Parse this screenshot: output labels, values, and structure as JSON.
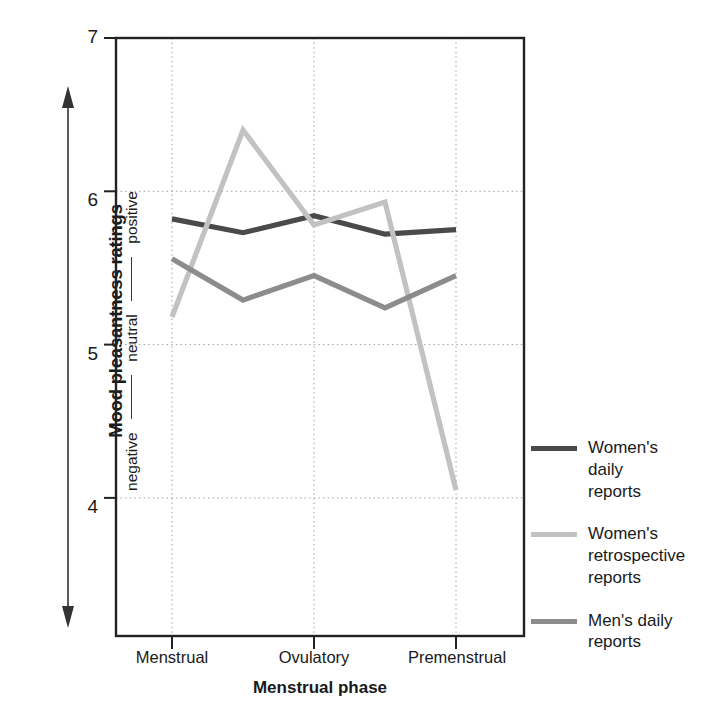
{
  "chart_data": {
    "type": "line",
    "title": "",
    "xlabel": "Menstrual phase",
    "ylabel": "Mood pleasantness ratings",
    "ylabel_scale": [
      "negative",
      "neutral",
      "positive"
    ],
    "categories": [
      "Menstrual",
      "",
      "Ovulatory",
      "",
      "Premenstrual"
    ],
    "x_tick_labels": [
      "Menstrual",
      "Ovulatory",
      "Premenstrual"
    ],
    "x_tick_positions": [
      0,
      2,
      4
    ],
    "y_tick_labels": [
      "7",
      "6",
      "5",
      "4"
    ],
    "y_ticks": [
      7,
      6,
      5,
      4
    ],
    "ylim": [
      3.35,
      7
    ],
    "xlim": [
      -0.42,
      0.42
    ],
    "grid": "dotted",
    "legend_position": "right",
    "series": [
      {
        "name": "Women's daily reports",
        "legend_label": "Women's\ndaily\nreports",
        "color": "#4a4a4a",
        "values": [
          5.82,
          5.73,
          5.84,
          5.72,
          5.75
        ]
      },
      {
        "name": "Women's retrospective reports",
        "legend_label": "Women's\nretrospective\nreports",
        "color": "#c2c2c2",
        "values": [
          5.18,
          6.4,
          5.78,
          5.93,
          4.05
        ]
      },
      {
        "name": "Men's daily reports",
        "legend_label": "Men's daily\nreports",
        "color": "#8c8c8c",
        "values": [
          5.56,
          5.29,
          5.45,
          5.24,
          5.45
        ]
      }
    ]
  },
  "axes": {
    "y_title": "Mood pleasantness ratings",
    "y_words": {
      "negative": "negative",
      "neutral": "neutral",
      "positive": "positive"
    },
    "x_title": "Menstrual phase",
    "x_labels": [
      "Menstrual",
      "Ovulatory",
      "Premenstrual"
    ],
    "y_labels": [
      "7",
      "6",
      "5",
      "4"
    ]
  },
  "legend": {
    "items": [
      {
        "label": "Women's\ndaily\nreports",
        "color": "#4a4a4a"
      },
      {
        "label": "Women's\nretrospective\nreports",
        "color": "#c2c2c2"
      },
      {
        "label": "Men's daily\nreports",
        "color": "#8c8c8c"
      }
    ]
  }
}
